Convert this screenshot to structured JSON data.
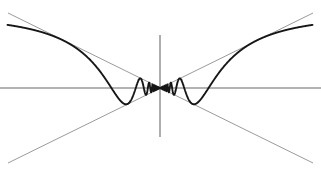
{
  "figure": {
    "title": "",
    "background_color": "#ffffff",
    "width": 321,
    "height": 173
  },
  "axes": {
    "x_axis_label": "",
    "y_axis_label": "",
    "axis_color": "#9a9a9a",
    "axis_width": 1.6,
    "x_axis_pixel_y": 88,
    "y_axis_pixel_x": 160,
    "x_axis_pixel_start": 0,
    "x_axis_pixel_end": 321,
    "y_axis_pixel_top": 35,
    "y_axis_pixel_bottom": 137
  },
  "envelope": {
    "label_upper": "y = |x|",
    "label_lower": "y = -|x|",
    "color": "#8e8e8e",
    "width": 0.9,
    "line_a_start": [
      8,
      13
    ],
    "line_a_end": [
      313,
      163
    ],
    "line_b_start": [
      8,
      163
    ],
    "line_b_end": [
      313,
      13
    ]
  },
  "curve": {
    "label": "y = x sin(1/x)",
    "color": "#161616",
    "width": 1.9,
    "fill": "none"
  },
  "chart_data": {
    "type": "line",
    "title": "",
    "subtitle": "",
    "xlabel": "",
    "ylabel": "",
    "xlim": [
      -1,
      1
    ],
    "ylim": [
      -1,
      1
    ],
    "grid": false,
    "legend_position": "none",
    "annotations": [],
    "tick_labels_x": [],
    "tick_labels_y": [],
    "series": [
      {
        "name": "y = x sin(1/x)",
        "type": "line",
        "color": "#161616",
        "function": "x*sin(1/x)",
        "samples": 4000,
        "x_domain": [
          -1,
          1
        ],
        "key_points": [
          {
            "name": "left-endpoint",
            "x": -1.0,
            "y": -0.841
          },
          {
            "name": "trough-1-left",
            "x": -0.776,
            "y": -0.776
          },
          {
            "name": "zero-left-1",
            "x": -0.637,
            "y": 0.0
          },
          {
            "name": "peak-1-left",
            "x": -0.488,
            "y": 0.488
          },
          {
            "name": "zero-left-2",
            "x": -0.318,
            "y": 0.0
          },
          {
            "name": "trough-2-left",
            "x": -0.249,
            "y": -0.249
          },
          {
            "name": "zero-left-3",
            "x": -0.212,
            "y": 0.0
          },
          {
            "name": "peak-2-left",
            "x": -0.166,
            "y": 0.166
          },
          {
            "name": "zero-left-4",
            "x": -0.159,
            "y": 0.0
          },
          {
            "name": "origin-limit",
            "x": 0.0,
            "y": 0.0
          },
          {
            "name": "peak-2-right",
            "x": 0.166,
            "y": -0.166
          },
          {
            "name": "trough-2-right",
            "x": 0.249,
            "y": 0.249
          },
          {
            "name": "peak-1-right",
            "x": 0.488,
            "y": -0.488
          },
          {
            "name": "trough-1-right",
            "x": 0.776,
            "y": 0.776
          },
          {
            "name": "right-endpoint",
            "x": 1.0,
            "y": 0.841
          }
        ]
      },
      {
        "name": "upper envelope y = |x|",
        "type": "line",
        "color": "#8e8e8e",
        "x": [
          -1,
          0,
          1
        ],
        "values": [
          1,
          0,
          1
        ]
      },
      {
        "name": "lower envelope y = -|x|",
        "type": "line",
        "color": "#8e8e8e",
        "x": [
          -1,
          0,
          1
        ],
        "values": [
          -1,
          0,
          -1
        ]
      }
    ]
  }
}
